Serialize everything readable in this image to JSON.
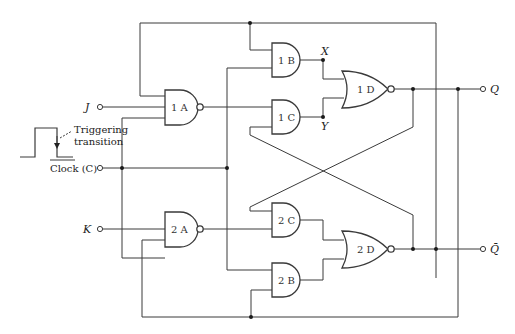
{
  "diagram": {
    "type": "logic-circuit",
    "inputs": {
      "j": "J",
      "clock": "Clock (C)",
      "k": "K"
    },
    "outputs": {
      "q": "Q",
      "q_bar": "Q̄"
    },
    "clock_annotation": {
      "line1": "Triggering",
      "line2": "transition"
    },
    "gates": {
      "g1a": "1 A",
      "g1b": "1 B",
      "g1c": "1 C",
      "g1d": "1 D",
      "g2a": "2 A",
      "g2b": "2 B",
      "g2c": "2 C",
      "g2d": "2 D"
    },
    "gate_types": {
      "1A": "NAND",
      "2A": "NAND",
      "1B": "AND",
      "1C": "AND",
      "2B": "AND",
      "2C": "AND",
      "1D": "NOR",
      "2D": "NOR"
    },
    "nodes": {
      "x": "X",
      "y": "Y"
    }
  }
}
